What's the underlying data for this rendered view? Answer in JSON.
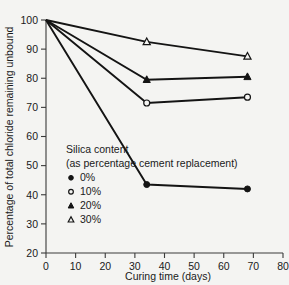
{
  "chart_data": {
    "type": "line",
    "title": "",
    "xlabel": "Curing time (days)",
    "ylabel": "Percentage of total chloride remaining unbound",
    "xlim": [
      0,
      80
    ],
    "ylim": [
      20,
      100
    ],
    "xticks": [
      0,
      10,
      20,
      30,
      40,
      50,
      60,
      70,
      80
    ],
    "yticks": [
      20,
      30,
      40,
      50,
      60,
      70,
      80,
      90,
      100
    ],
    "grid": false,
    "legend_position": "inside-lower-left",
    "legend_title": "Silica content",
    "legend_subtitle": "(as percentage cement replacement)",
    "x": [
      0,
      34,
      68
    ],
    "series": [
      {
        "name": "0%",
        "marker": "filled-circle",
        "values": [
          100,
          43.5,
          42.0
        ]
      },
      {
        "name": "10%",
        "marker": "open-circle",
        "values": [
          100,
          71.5,
          73.5
        ]
      },
      {
        "name": "20%",
        "marker": "filled-triangle",
        "values": [
          100,
          79.5,
          80.5
        ]
      },
      {
        "name": "30%",
        "marker": "open-triangle",
        "values": [
          100,
          92.5,
          87.5
        ]
      }
    ]
  },
  "colors": {
    "background": "#f4f4f2",
    "ink": "#141414",
    "axis": "#3a3a3a"
  }
}
